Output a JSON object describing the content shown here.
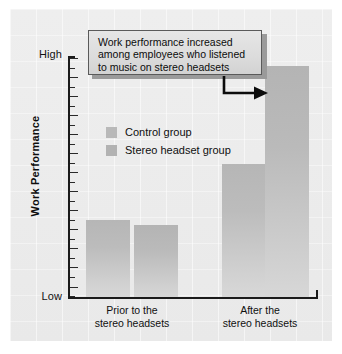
{
  "chart_data": {
    "type": "bar",
    "title": "",
    "subtitle": "",
    "xlabel": "",
    "ylabel": "Work Performance",
    "categories": [
      "Prior to the\nstereo headsets",
      "After the\nstereo headsets"
    ],
    "series": [
      {
        "name": "Control group",
        "values": [
          32,
          55
        ]
      },
      {
        "name": "Stereo headset group",
        "values": [
          30,
          96
        ]
      }
    ],
    "ylim": [
      0,
      100
    ],
    "y_tick_labels": [
      "Low",
      "High"
    ],
    "y_axis_low_label": "Low",
    "y_axis_high_label": "High",
    "grid": false,
    "legend_position": "inside-upper-left",
    "annotations": [
      {
        "text": "Work performance increased\namong employees who listened\nto music on stereo headsets",
        "points_to": "After the stereo headsets / Stereo headset group bar"
      }
    ],
    "n_major_ticks": 13,
    "n_minor_ticks": 12
  },
  "axis": {
    "y_title": "Work Performance",
    "high_label": "High",
    "low_label": "Low"
  },
  "legend": {
    "items": [
      {
        "label": "Control group",
        "color": "#b9b9b9"
      },
      {
        "label": "Stereo headset group",
        "color": "#b2b2b2"
      }
    ]
  },
  "groups": [
    {
      "label": "Prior to the\nstereo headsets"
    },
    {
      "label": "After the\nstereo headsets"
    }
  ],
  "callout": {
    "text": "Work performance increased\namong employees who listened\nto music on stereo headsets"
  },
  "colors": {
    "plate": "#ececec",
    "axis": "#1b1b1b",
    "bar_control": "#bcbcbc",
    "bar_stereo": "#bababa",
    "callout_fill": "#dcdcdc",
    "callout_border": "#5a5a5a",
    "text": "#101010"
  }
}
